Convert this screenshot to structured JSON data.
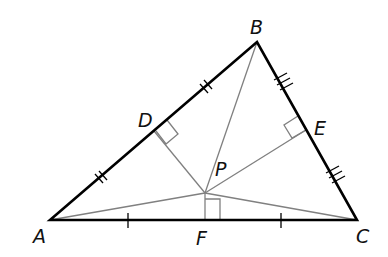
{
  "diagram": {
    "type": "geometry-triangle-circumcenter",
    "vertices": {
      "A": {
        "label": "A",
        "x": 50,
        "y": 220
      },
      "B": {
        "label": "B",
        "x": 257,
        "y": 42
      },
      "C": {
        "label": "C",
        "x": 357,
        "y": 220
      }
    },
    "midpoints": {
      "D": {
        "label": "D",
        "on": "AB"
      },
      "E": {
        "label": "E",
        "on": "BC"
      },
      "F": {
        "label": "F",
        "on": "AC"
      }
    },
    "center": {
      "label": "P"
    },
    "labels": {
      "A": "A",
      "B": "B",
      "C": "C",
      "D": "D",
      "E": "E",
      "F": "F",
      "P": "P"
    },
    "tick_marks": {
      "AB": 2,
      "BC": 3,
      "AC": 1
    },
    "right_angles": [
      "D",
      "E",
      "F"
    ],
    "colors": {
      "triangle": "#000000",
      "inner_lines": "#777777",
      "background": "#ffffff"
    }
  }
}
